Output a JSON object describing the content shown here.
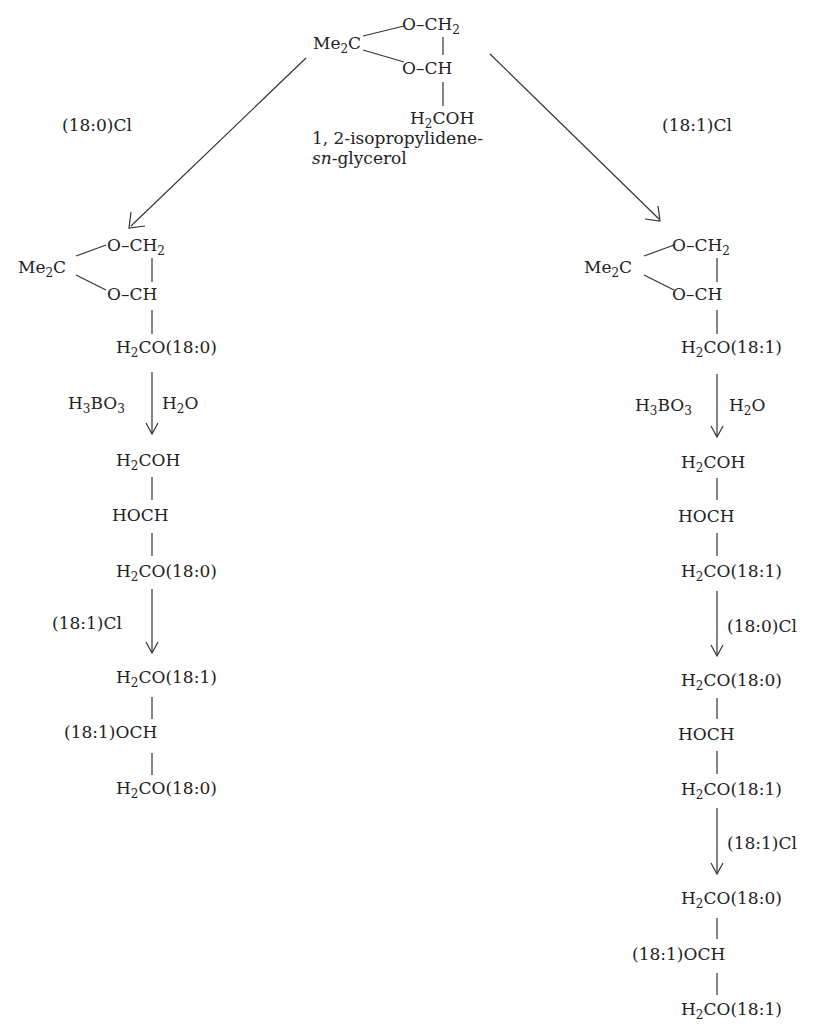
{
  "diagram": {
    "type": "reaction-scheme",
    "start": {
      "ring_carbon": "Me₂C",
      "ring_top": "O–CH₂",
      "ring_bottom": "O–CH",
      "tail": "H₂COH",
      "name_line1": "1, 2-isopropylidene-",
      "name_line2_italic": "sn",
      "name_line2_rest": "-glycerol"
    },
    "left_branch": {
      "reagent1": "(18:0)Cl",
      "intermediate1": {
        "ring_carbon": "Me₂C",
        "ring_top": "O–CH₂",
        "ring_bottom": "O–CH",
        "tail": "H₂CO(18:0)"
      },
      "step2_left_reagent": "H₃BO₃",
      "step2_right_reagent": "H₂O",
      "intermediate2": [
        "H₂COH",
        "HOCH",
        "H₂CO(18:0)"
      ],
      "step3_reagent": "(18:1)Cl",
      "product": [
        "H₂CO(18:1)",
        "(18:1)OCH",
        "H₂CO(18:0)"
      ]
    },
    "right_branch": {
      "reagent1": "(18:1)Cl",
      "intermediate1": {
        "ring_carbon": "Me₂C",
        "ring_top": "O–CH₂",
        "ring_bottom": "O–CH",
        "tail": "H₂CO(18:1)"
      },
      "step2_left_reagent": "H₃BO₃",
      "step2_right_reagent": "H₂O",
      "intermediate2": [
        "H₂COH",
        "HOCH",
        "H₂CO(18:1)"
      ],
      "step3_reagent": "(18:0)Cl",
      "intermediate3": [
        "H₂CO(18:0)",
        "HOCH",
        "H₂CO(18:1)"
      ],
      "step4_reagent": "(18:1)Cl",
      "product": [
        "H₂CO(18:0)",
        "(18:1)OCH",
        "H₂CO(18:1)"
      ]
    }
  }
}
